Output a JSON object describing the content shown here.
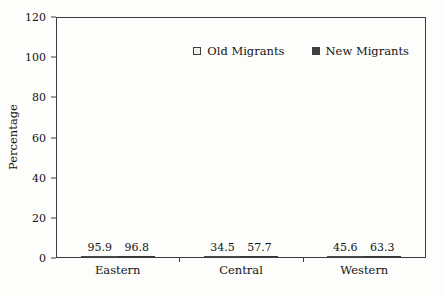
{
  "chart_data": {
    "type": "bar",
    "title": "",
    "xlabel": "",
    "ylabel": "Percentage",
    "categories": [
      "Eastern",
      "Central",
      "Western"
    ],
    "series": [
      {
        "name": "Old Migrants",
        "values": [
          95.9,
          34.5,
          45.6
        ],
        "fill": "#f1f1ea",
        "border": "#4b4b4b"
      },
      {
        "name": "New Migrants",
        "values": [
          96.8,
          57.7,
          63.3
        ],
        "fill": "#3e3e3e",
        "border": "#353535"
      }
    ],
    "ylim": [
      0,
      120
    ],
    "yticks": [
      0,
      20,
      40,
      60,
      80,
      100,
      120
    ],
    "grid": false,
    "value_labels": true,
    "legend_position": "top-right-inside"
  },
  "colors": {
    "background": "#fdfdfb",
    "frame": "#3d3d3d",
    "text": "#141414",
    "old_migrants_fill": "#f1f1ea",
    "new_migrants_fill": "#3e3e3e"
  }
}
